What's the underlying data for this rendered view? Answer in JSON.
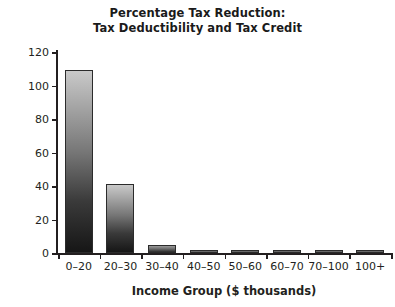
{
  "chart_data": {
    "type": "bar",
    "title": "Percentage Tax Reduction: Tax Deductibility and Tax Credit",
    "title_lines": [
      "Percentage Tax Reduction:",
      "Tax Deductibility and Tax Credit"
    ],
    "xlabel": "Income Group ($ thousands)",
    "ylabel": "Percent Tax Reduction",
    "categories": [
      "0–20",
      "20–30",
      "30–40",
      "40–50",
      "50–60",
      "60–70",
      "70–100",
      "100+"
    ],
    "values": [
      109,
      41,
      5,
      1.5,
      2,
      1.5,
      2,
      1.5
    ],
    "ylim": [
      0,
      120
    ],
    "yticks": [
      0,
      20,
      40,
      60,
      80,
      100,
      120
    ],
    "ytick_labels": [
      "0",
      "20",
      "40",
      "60",
      "80",
      "100",
      "120"
    ],
    "grid": false,
    "legend": "none",
    "bar_fill": "#8a8a8a",
    "bar_edge": "#2b2b2b",
    "background": "#ffffff",
    "text_color": "#231f20"
  }
}
